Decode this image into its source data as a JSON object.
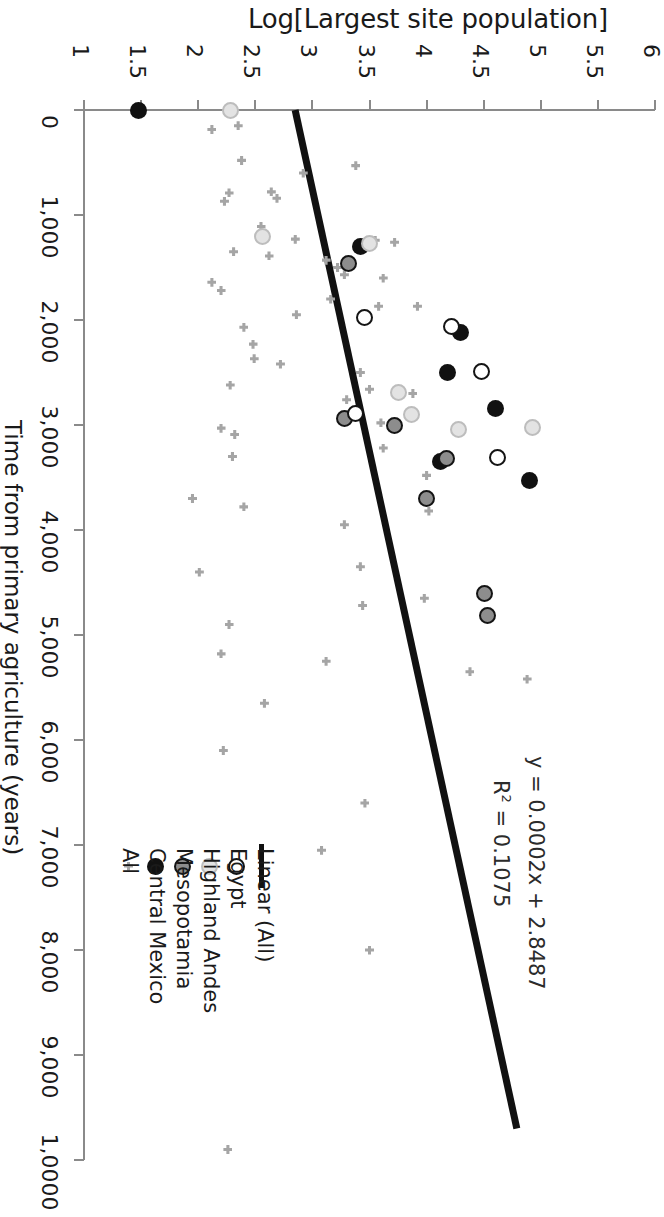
{
  "chart_data": {
    "type": "scatter",
    "title": "",
    "ylabel": "Log[Largest site population]",
    "xlabel": "Time from primary agriculture (years)",
    "xlim": [
      0,
      10000
    ],
    "ylim": [
      1,
      6
    ],
    "grid": false,
    "orientation": "rotated-90-clockwise",
    "x_ticks": [
      "0",
      "1,000",
      "2,000",
      "3,000",
      "4,000",
      "5,000",
      "6,000",
      "7,000",
      "8,000",
      "9,000",
      "1,0000"
    ],
    "x_tick_values": [
      0,
      1000,
      2000,
      3000,
      4000,
      5000,
      6000,
      7000,
      8000,
      9000,
      10000
    ],
    "y_ticks": [
      "1",
      "1.5",
      "2",
      "2.5",
      "3",
      "3.5",
      "4",
      "4.5",
      "5",
      "5.5",
      "6"
    ],
    "y_tick_values": [
      1,
      1.5,
      2,
      2.5,
      3,
      3.5,
      4,
      4.5,
      5,
      5.5,
      6
    ],
    "annotations": [
      "y = 0.0002x + 2.8487",
      "R² = 0.1075"
    ],
    "trendline": {
      "label": "Linear (All)",
      "slope": 0.0002,
      "intercept": 2.8487,
      "r_squared": 0.1075,
      "x_start": 0,
      "y_start": 2.8487,
      "x_end": 9700,
      "y_end": 4.79
    },
    "legend_position": "bottom-left",
    "series": [
      {
        "name": "All",
        "marker": "cross",
        "color": "#a5a5a5",
        "points": [
          [
            150,
            2.35
          ],
          [
            185,
            2.12
          ],
          [
            480,
            2.38
          ],
          [
            530,
            3.38
          ],
          [
            600,
            2.92
          ],
          [
            780,
            2.64
          ],
          [
            790,
            2.27
          ],
          [
            870,
            2.23
          ],
          [
            840,
            2.69
          ],
          [
            1110,
            2.55
          ],
          [
            1230,
            2.85
          ],
          [
            1240,
            3.55
          ],
          [
            1260,
            3.72
          ],
          [
            1350,
            2.31
          ],
          [
            1390,
            2.62
          ],
          [
            1430,
            3.12
          ],
          [
            1500,
            3.22
          ],
          [
            1570,
            3.28
          ],
          [
            1600,
            3.62
          ],
          [
            1640,
            2.12
          ],
          [
            1720,
            2.2
          ],
          [
            1800,
            3.16
          ],
          [
            1870,
            3.58
          ],
          [
            1870,
            3.92
          ],
          [
            1950,
            2.86
          ],
          [
            2070,
            2.4
          ],
          [
            2230,
            2.48
          ],
          [
            2370,
            2.49
          ],
          [
            2420,
            2.72
          ],
          [
            2500,
            3.42
          ],
          [
            2620,
            2.28
          ],
          [
            2660,
            3.5
          ],
          [
            2700,
            3.88
          ],
          [
            2760,
            3.3
          ],
          [
            2980,
            3.6
          ],
          [
            3030,
            2.2
          ],
          [
            3090,
            2.32
          ],
          [
            3220,
            3.62
          ],
          [
            3300,
            2.3
          ],
          [
            3480,
            4.0
          ],
          [
            3700,
            1.95
          ],
          [
            3780,
            2.4
          ],
          [
            3820,
            4.02
          ],
          [
            3950,
            3.28
          ],
          [
            4350,
            3.42
          ],
          [
            4400,
            2.01
          ],
          [
            4650,
            3.98
          ],
          [
            4720,
            3.44
          ],
          [
            4900,
            2.27
          ],
          [
            5180,
            2.2
          ],
          [
            5250,
            3.12
          ],
          [
            5350,
            4.38
          ],
          [
            5420,
            4.88
          ],
          [
            5650,
            2.58
          ],
          [
            6100,
            2.22
          ],
          [
            6600,
            3.46
          ],
          [
            7050,
            3.08
          ],
          [
            8000,
            3.5
          ],
          [
            9900,
            2.26
          ]
        ]
      },
      {
        "name": "Central Mexico",
        "marker": "filled-circle",
        "color": "#111111",
        "points": [
          [
            0,
            1.48
          ],
          [
            1300,
            3.42
          ],
          [
            2120,
            4.3
          ],
          [
            2500,
            4.18
          ],
          [
            2840,
            4.6
          ],
          [
            3350,
            4.12
          ],
          [
            3530,
            4.9
          ]
        ]
      },
      {
        "name": "Mesopotamia",
        "marker": "circle-gray-ring",
        "color": "#8d8d8d",
        "points": [
          [
            1460,
            3.32
          ],
          [
            2940,
            3.28
          ],
          [
            3000,
            3.72
          ],
          [
            3320,
            4.17
          ],
          [
            3700,
            4.0
          ],
          [
            4600,
            4.51
          ],
          [
            4810,
            4.53
          ]
        ]
      },
      {
        "name": "Highland Andes",
        "marker": "circle-light",
        "color": "#e3e3e3",
        "points": [
          [
            0,
            2.28
          ],
          [
            1200,
            2.56
          ],
          [
            1270,
            3.5
          ],
          [
            2690,
            3.75
          ],
          [
            2900,
            3.87
          ],
          [
            3040,
            4.28
          ],
          [
            3020,
            4.93
          ]
        ]
      },
      {
        "name": "Egypt",
        "marker": "open-circle",
        "color": "#ffffff",
        "points": [
          [
            1980,
            3.46
          ],
          [
            2060,
            4.22
          ],
          [
            2490,
            4.48
          ],
          [
            2890,
            3.38
          ],
          [
            3310,
            4.62
          ]
        ]
      }
    ]
  },
  "axes": {
    "y_title": "Log[Largest site population]",
    "x_title": "Time from primary agriculture (years)",
    "y_tick_labels": [
      "1",
      "1.5",
      "2",
      "2.5",
      "3",
      "3.5",
      "4",
      "4.5",
      "5",
      "5.5",
      "6"
    ],
    "x_tick_labels": [
      "0",
      "1,000",
      "2,000",
      "3,000",
      "4,000",
      "5,000",
      "6,000",
      "7,000",
      "8,000",
      "9,000",
      "1,0000"
    ]
  },
  "equation": {
    "line1": "y = 0.0002x + 2.8487",
    "line2_prefix": "R",
    "line2_sup": "2",
    "line2_suffix": " = 0.1075"
  },
  "legend": {
    "items": [
      {
        "label": "All",
        "marker": "cross"
      },
      {
        "label": "Central Mexico",
        "marker": "filled-circle"
      },
      {
        "label": "Mesopotamia",
        "marker": "circle-gray-ring"
      },
      {
        "label": "Highland Andes",
        "marker": "circle-light"
      },
      {
        "label": "Egypt",
        "marker": "open-circle"
      },
      {
        "label": "Linear (All)",
        "marker": "line"
      }
    ]
  },
  "colors": {
    "all": "#a5a5a5",
    "central_mexico": "#111111",
    "mesopotamia": "#8d8d8d",
    "highland_andes": "#e3e3e3",
    "egypt": "#ffffff",
    "trendline": "#111111",
    "axis": "#8a8a8a"
  }
}
